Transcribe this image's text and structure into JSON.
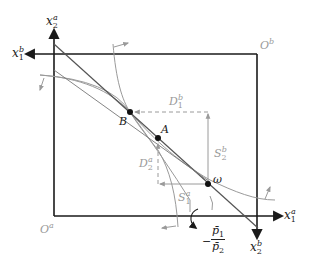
{
  "diagram": {
    "type": "edgeworth-box",
    "axes": {
      "x2a": {
        "base": "x",
        "sub": "2",
        "sup": "a"
      },
      "x1b": {
        "base": "x",
        "sub": "1",
        "sup": "b"
      },
      "x1a": {
        "base": "x",
        "sub": "1",
        "sup": "a"
      },
      "x2b": {
        "base": "x",
        "sub": "2",
        "sup": "b"
      }
    },
    "origins": {
      "a": {
        "base": "O",
        "sup": "a"
      },
      "b": {
        "base": "O",
        "sup": "b"
      }
    },
    "points": {
      "A": "A",
      "B": "B",
      "omega": "ω"
    },
    "quantities": {
      "D1b": {
        "base": "D",
        "sub": "1",
        "sup": "b"
      },
      "S2b": {
        "base": "S",
        "sub": "2",
        "sup": "b"
      },
      "D2a": {
        "base": "D",
        "sub": "2",
        "sup": "a"
      },
      "S1a": {
        "base": "S",
        "sub": "1",
        "sup": "a"
      }
    },
    "price_ratio": {
      "sign": "−",
      "numerator": "p̄",
      "numerator_sub": "1",
      "denominator": "p̄",
      "denominator_sub": "2"
    },
    "colors": {
      "axis": "#1a1a1a",
      "curve": "#9a9a9a",
      "budget_line": "#555555",
      "point": "#111111"
    }
  }
}
